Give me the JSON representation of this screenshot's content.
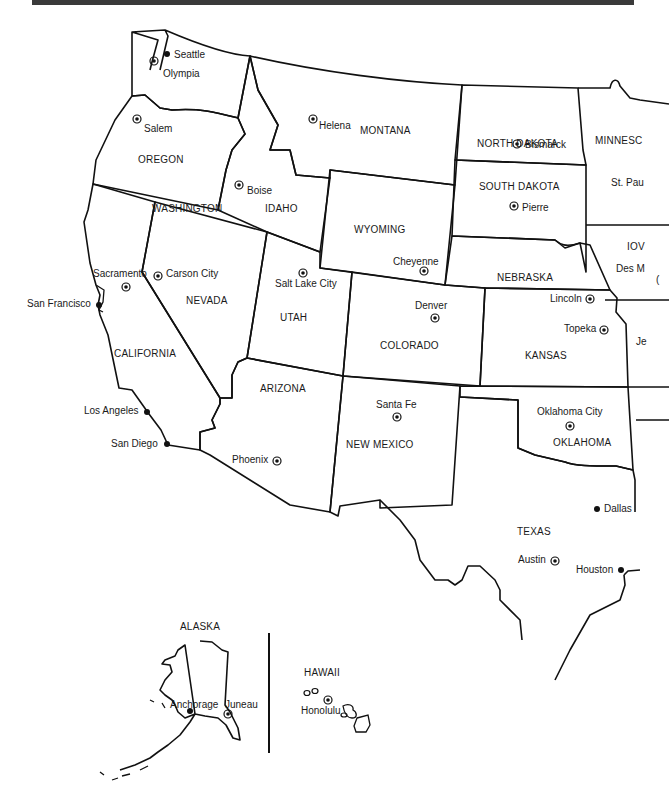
{
  "map": {
    "title": "Western United States",
    "colors": {
      "border": "#111111",
      "background": "#ffffff",
      "topbar": "#3a3a3a"
    },
    "states": [
      {
        "name": "WASHINGTON",
        "x": 152,
        "y": 204
      },
      {
        "name": "OREGON",
        "x": 138,
        "y": 155
      },
      {
        "name": "CALIFORNIA",
        "x": 114,
        "y": 349
      },
      {
        "name": "NEVADA",
        "x": 186,
        "y": 296
      },
      {
        "name": "IDAHO",
        "x": 265,
        "y": 204
      },
      {
        "name": "MONTANA",
        "x": 360,
        "y": 126
      },
      {
        "name": "WYOMING",
        "x": 354,
        "y": 225
      },
      {
        "name": "UTAH",
        "x": 280,
        "y": 313
      },
      {
        "name": "ARIZONA",
        "x": 260,
        "y": 384
      },
      {
        "name": "COLORADO",
        "x": 380,
        "y": 341
      },
      {
        "name": "NEW MEXICO",
        "x": 346,
        "y": 440
      },
      {
        "name": "NORTH DAKOTA",
        "x": 477,
        "y": 139
      },
      {
        "name": "SOUTH DAKOTA",
        "x": 479,
        "y": 182
      },
      {
        "name": "NEBRASKA",
        "x": 497,
        "y": 273
      },
      {
        "name": "KANSAS",
        "x": 525,
        "y": 351
      },
      {
        "name": "OKLAHOMA",
        "x": 553,
        "y": 438
      },
      {
        "name": "TEXAS",
        "x": 517,
        "y": 527
      },
      {
        "name": "MINNESC",
        "x": 595,
        "y": 136
      },
      {
        "name": "IOV",
        "x": 627,
        "y": 242
      },
      {
        "name": "ALASKA",
        "x": 180,
        "y": 622
      },
      {
        "name": "HAWAII",
        "x": 304,
        "y": 668
      }
    ],
    "capitals": [
      {
        "name": "Olympia",
        "x": 163,
        "y": 69,
        "mx": 154,
        "my": 61
      },
      {
        "name": "Salem",
        "x": 144,
        "y": 124,
        "mx": 137,
        "my": 119
      },
      {
        "name": "Boise",
        "x": 247,
        "y": 186,
        "mx": 239,
        "my": 185
      },
      {
        "name": "Helena",
        "x": 319,
        "y": 121,
        "mx": 313,
        "my": 119
      },
      {
        "name": "Bismarck",
        "x": 525,
        "y": 140,
        "mx": 517,
        "my": 144
      },
      {
        "name": "Pierre",
        "x": 522,
        "y": 203,
        "mx": 514,
        "my": 206
      },
      {
        "name": "Cheyenne",
        "x": 393,
        "y": 257,
        "mx": 424,
        "my": 271
      },
      {
        "name": "Salt Lake City",
        "x": 275,
        "y": 279,
        "mx": 303,
        "my": 273
      },
      {
        "name": "Carson City",
        "x": 166,
        "y": 269,
        "mx": 158,
        "my": 276
      },
      {
        "name": "Sacramento",
        "x": 93,
        "y": 269,
        "mx": 126,
        "my": 287
      },
      {
        "name": "Denver",
        "x": 415,
        "y": 301,
        "mx": 435,
        "my": 318
      },
      {
        "name": "Lincoln",
        "x": 550,
        "y": 294,
        "mx": 590,
        "my": 299
      },
      {
        "name": "Topeka",
        "x": 564,
        "y": 324,
        "mx": 604,
        "my": 330
      },
      {
        "name": "Santa Fe",
        "x": 376,
        "y": 400,
        "mx": 397,
        "my": 417
      },
      {
        "name": "Oklahoma City",
        "x": 537,
        "y": 407,
        "mx": 570,
        "my": 426
      },
      {
        "name": "Phoenix",
        "x": 232,
        "y": 455,
        "mx": 277,
        "my": 461
      },
      {
        "name": "Austin",
        "x": 518,
        "y": 555,
        "mx": 555,
        "my": 561
      },
      {
        "name": "Juneau",
        "x": 225,
        "y": 700,
        "mx": 228,
        "my": 714
      },
      {
        "name": "Honolulu",
        "x": 301,
        "y": 697,
        "mx": 328,
        "my": 700
      }
    ],
    "cities": [
      {
        "name": "Seattle",
        "x": 174,
        "y": 52,
        "mx": 167,
        "my": 54
      },
      {
        "name": "San Francisco",
        "x": 27,
        "y": 299,
        "mx": 99,
        "my": 305
      },
      {
        "name": "Los Angeles",
        "x": 84,
        "y": 406,
        "mx": 147,
        "my": 412
      },
      {
        "name": "San Diego",
        "x": 111,
        "y": 439,
        "mx": 167,
        "my": 444
      },
      {
        "name": "Dallas",
        "x": 604,
        "y": 504,
        "mx": 597,
        "my": 509
      },
      {
        "name": "Houston",
        "x": 576,
        "y": 565,
        "mx": 621,
        "my": 570
      },
      {
        "name": "Anchorage",
        "x": 173,
        "y": 700,
        "mx": 190,
        "my": 711
      }
    ],
    "clipped_labels": [
      {
        "name": "St. Pau",
        "x": 611,
        "y": 178
      },
      {
        "name": "Des M",
        "x": 616,
        "y": 264
      },
      {
        "name": "(",
        "x": 656,
        "y": 275
      },
      {
        "name": "Je",
        "x": 636,
        "y": 337
      }
    ]
  }
}
